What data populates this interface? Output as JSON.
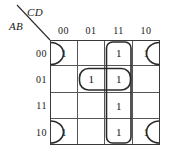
{
  "diagram": {
    "type": "karnaugh-map",
    "variables": [
      "A",
      "B",
      "C",
      "D"
    ],
    "column_axis_label": "CD",
    "row_axis_label": "AB",
    "column_headers": [
      "00",
      "01",
      "11",
      "10"
    ],
    "row_headers": [
      "00",
      "01",
      "11",
      "10"
    ],
    "cells": [
      [
        "1",
        "",
        "1",
        "1"
      ],
      [
        "",
        "1",
        "1",
        ""
      ],
      [
        "",
        "",
        "1",
        ""
      ],
      [
        "1",
        "",
        "1",
        "1"
      ]
    ],
    "groups": [
      {
        "name": "vertical-group-column-11",
        "shape": "rounded-rect",
        "cells": [
          [
            0,
            2
          ],
          [
            1,
            2
          ],
          [
            2,
            2
          ],
          [
            3,
            2
          ]
        ]
      },
      {
        "name": "horizontal-group-row-01",
        "shape": "rounded-rect",
        "cells": [
          [
            1,
            1
          ],
          [
            1,
            2
          ]
        ]
      },
      {
        "name": "wrap-group-row-00-left",
        "shape": "half-oval-open-left",
        "cells": [
          [
            0,
            0
          ]
        ]
      },
      {
        "name": "wrap-group-row-00-right",
        "shape": "half-oval-open-right",
        "cells": [
          [
            0,
            3
          ]
        ]
      },
      {
        "name": "wrap-group-row-10-left",
        "shape": "half-oval-open-left",
        "cells": [
          [
            3,
            0
          ]
        ]
      },
      {
        "name": "wrap-group-row-10-right",
        "shape": "half-oval-open-right",
        "cells": [
          [
            3,
            3
          ]
        ]
      }
    ],
    "colors": {
      "grid_line": "#555555",
      "grid_border": "#3a3a3a",
      "group_outline": "#2b2b2b",
      "text": "#1a1a1a",
      "background": "#ffffff"
    }
  }
}
